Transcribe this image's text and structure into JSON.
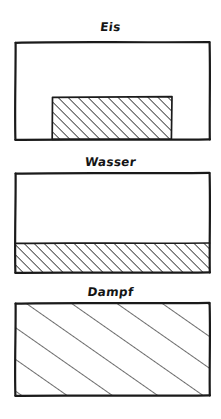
{
  "figure": {
    "background_color": "#ffffff",
    "ink_color": "#1a1a1a",
    "style": "hand-drawn-sketch",
    "width": 221,
    "height": 419
  },
  "panels": [
    {
      "id": "eis",
      "label": "Eis",
      "label_center_x": 112,
      "label_baseline_y": 31,
      "box": {
        "x": 15,
        "y": 42,
        "width": 195,
        "height": 97
      },
      "fill": {
        "kind": "hatched-block",
        "description": "dense diagonal hatching in a solid rectangular block resting on the container floor",
        "x": 52,
        "y": 97,
        "width": 120,
        "height": 42,
        "hatch_spacing": 5,
        "hatch_angle_deg": 45
      }
    },
    {
      "id": "wasser",
      "label": "Wasser",
      "label_center_x": 112,
      "label_baseline_y": 166,
      "box": {
        "x": 15,
        "y": 173,
        "width": 195,
        "height": 99
      },
      "fill": {
        "kind": "hatched-level",
        "description": "dense diagonal hatching filling the lower portion of the container to a flat level",
        "x": 15,
        "y": 243,
        "width": 195,
        "height": 29,
        "hatch_spacing": 5,
        "hatch_angle_deg": 45
      }
    },
    {
      "id": "dampf",
      "label": "Dampf",
      "label_center_x": 112,
      "label_baseline_y": 296,
      "box": {
        "x": 15,
        "y": 303,
        "width": 195,
        "height": 92
      },
      "fill": {
        "kind": "hatched-full",
        "description": "sparse widely spaced diagonal hatching filling the entire container",
        "x": 15,
        "y": 303,
        "width": 195,
        "height": 92,
        "hatch_spacing": 26,
        "hatch_angle_deg": 55
      }
    }
  ]
}
